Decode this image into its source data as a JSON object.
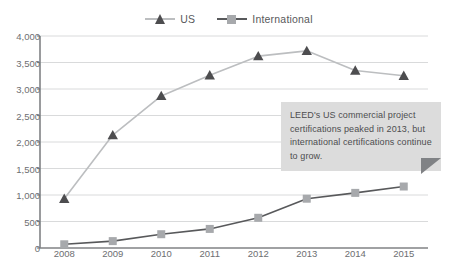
{
  "legend": {
    "position": "top-center",
    "entries": [
      {
        "label": "US",
        "marker": "triangle-marker-icon",
        "marker_color": "#4d4d4f",
        "line_color": "#bcbec0"
      },
      {
        "label": "International",
        "marker": "square-marker-icon",
        "marker_color": "#a7a9ac",
        "line_color": "#58595b"
      }
    ]
  },
  "colors": {
    "us_line": "#bcbec0",
    "us_marker": "#4d4d4f",
    "intl_line": "#58595b",
    "intl_marker": "#a7a9ac",
    "gridline": "#d9dadb",
    "axis": "#808285",
    "tick_text": "#6d6e71",
    "callout_bg": "#dcdcdc",
    "callout_tail": "#808285",
    "callout_text": "#4d4d4f",
    "background": "#ffffff"
  },
  "callout": {
    "text": "LEED's US commercial project certifications peaked in 2013, but international certifications continue to grow."
  },
  "chart_data": {
    "type": "line",
    "title": "",
    "subtitle": "",
    "xlabel": "",
    "ylabel": "",
    "categories": [
      "2008",
      "2009",
      "2010",
      "2011",
      "2012",
      "2013",
      "2014",
      "2015"
    ],
    "series": [
      {
        "name": "US",
        "values": [
          930,
          2130,
          2870,
          3260,
          3620,
          3720,
          3350,
          3250
        ]
      },
      {
        "name": "International",
        "values": [
          70,
          130,
          260,
          360,
          570,
          930,
          1040,
          1160
        ]
      }
    ],
    "ylim": [
      0,
      4000
    ],
    "ytick_values": [
      0,
      500,
      1000,
      1500,
      2000,
      2500,
      3000,
      3500,
      4000
    ],
    "ytick_labels": [
      "0",
      "500",
      "1,000",
      "1,500",
      "2,000",
      "2,500",
      "3,000",
      "3,500",
      "4,000"
    ],
    "grid": true,
    "grid_axis": "y",
    "legend_position": "top-center",
    "annotations": [
      {
        "text": "LEED's US commercial project certifications peaked in 2013, but international certifications continue to grow."
      }
    ]
  }
}
